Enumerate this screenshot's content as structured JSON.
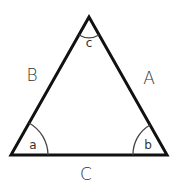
{
  "diagram": {
    "type": "triangle",
    "vertices": {
      "apex": [
        89,
        17
      ],
      "left": [
        11,
        155
      ],
      "right": [
        167,
        155
      ]
    },
    "colors": {
      "stroke": "#111111",
      "arc": "#444444",
      "text": "#333333",
      "background": "#ffffff"
    },
    "sides": [
      {
        "id": "B",
        "label": "B",
        "position": [
          32,
          81
        ]
      },
      {
        "id": "A",
        "label": "A",
        "position": [
          149,
          84
        ]
      },
      {
        "id": "C",
        "label": "C",
        "position": [
          86,
          179
        ]
      }
    ],
    "angles": [
      {
        "id": "a",
        "label": "a",
        "position": [
          33,
          147
        ]
      },
      {
        "id": "b",
        "label": "b",
        "position": [
          147,
          147
        ]
      },
      {
        "id": "c",
        "label": "c",
        "position": [
          89,
          46
        ]
      }
    ]
  }
}
